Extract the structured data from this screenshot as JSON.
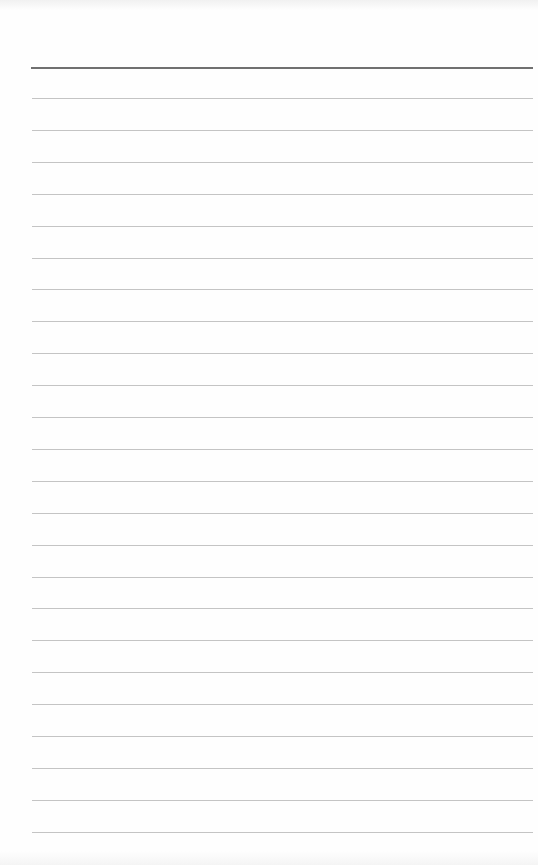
{
  "document": {
    "type": "lined-paper",
    "width": 538,
    "height": 865,
    "background_color": "#fefefe",
    "header_rule": {
      "y": 67,
      "x_start": 31,
      "x_end": 533,
      "color": "#707070"
    },
    "ruled_lines": {
      "count": 24,
      "first_y": 98,
      "spacing": 31.9,
      "x_start": 32,
      "x_end": 533,
      "color": "#c4c4c4"
    },
    "text_content": []
  }
}
